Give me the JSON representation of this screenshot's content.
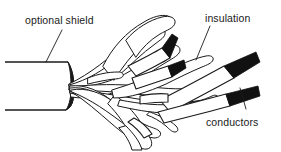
{
  "figure": {
    "type": "line-art-technical-illustration",
    "background_color": "#ffffff",
    "ink_color": "#1a1a1a",
    "conductor_color": "#111111",
    "width": 281,
    "height": 152
  },
  "labels": {
    "shield": "optional shield",
    "insulation": "insulation",
    "conductors": "conductors"
  },
  "parts": {
    "jacket": "cable-jacket",
    "jacket_cut_end": "jacket-cut-end",
    "braid": "braided-shield",
    "insulated_wires": "insulated-wires",
    "bare_conductors": "bare-conductor-tips"
  },
  "counts": {
    "visible_conductor_tips": 4,
    "insulated_wires": 4,
    "braid_strands": 14
  }
}
